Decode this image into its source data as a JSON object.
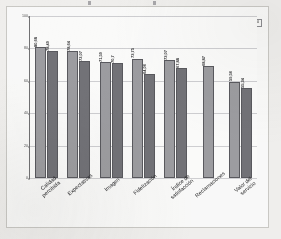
{
  "chart_data": {
    "type": "bar",
    "title": "",
    "xlabel": "",
    "ylabel": "",
    "ylim": [
      0,
      100
    ],
    "yticks": [
      0,
      20,
      40,
      60,
      80,
      100
    ],
    "grid": true,
    "legend_position": "top-right",
    "categories": [
      "Calidad percibida",
      "Expectativas",
      "Imagen",
      "Fidelización",
      "Índice de satisfacción",
      "Reclamaciones",
      "Valor del servicio"
    ],
    "series": [
      {
        "name": "1999",
        "color": "#9b9b9f",
        "values": [
          80.68,
          78.64,
          71.59,
          73.75,
          73.07,
          68.87,
          59.56
        ]
      },
      {
        "name": "2000",
        "color": "#6f6f74",
        "values": [
          78.49,
          72.07,
          70.7,
          64.06,
          67.88,
          null,
          55.34
        ]
      }
    ]
  },
  "axis": {
    "y_tick_labels": [
      "0",
      "20",
      "40",
      "60",
      "80",
      "100"
    ]
  },
  "categories_wrapped": [
    {
      "l1": "Calidad",
      "l2": "percibida"
    },
    {
      "l1": "Expectativas",
      "l2": ""
    },
    {
      "l1": "Imagen",
      "l2": ""
    },
    {
      "l1": "Fidelización",
      "l2": ""
    },
    {
      "l1": "Índice de",
      "l2": "satisfacción"
    },
    {
      "l1": "Reclamaciones",
      "l2": ""
    },
    {
      "l1": "Valor del",
      "l2": "servicio"
    }
  ],
  "legend": {
    "items": [
      {
        "label": "1999",
        "color": "#9b9b9f"
      },
      {
        "label": "2000",
        "color": "#6f6f74"
      }
    ]
  },
  "value_labels": [
    [
      "80,68",
      "78,49"
    ],
    [
      "78,64",
      "72,07"
    ],
    [
      "71,59",
      "70,7"
    ],
    [
      "73,75",
      "64,06"
    ],
    [
      "73,07",
      "67,88"
    ],
    [
      "68,87"
    ],
    [
      "59,56",
      "55,34"
    ]
  ]
}
